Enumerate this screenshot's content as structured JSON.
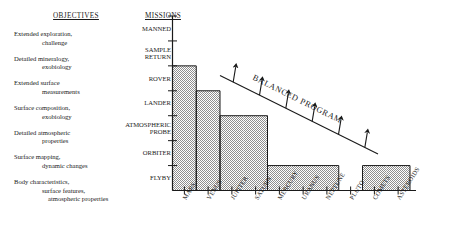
{
  "objectives": {
    "heading": "OBJECTIVES",
    "items": [
      [
        "Extended exploration,",
        "challenge"
      ],
      [
        "Detailed mineralogy,",
        "exobiology"
      ],
      [
        "Extended surface",
        "measurements"
      ],
      [
        "Surface composition,",
        "exobiology"
      ],
      [
        "Detailed atmospheric",
        "properties"
      ],
      [
        "Surface mapping,",
        "dynamic changes"
      ],
      [
        "Body characteristics,",
        "surface features,",
        "atmospheric properties"
      ]
    ]
  },
  "missions": {
    "heading": "MISSIONS",
    "levels": [
      {
        "label": "MANNED",
        "lines": [
          "MANNED"
        ]
      },
      {
        "label": "SAMPLE RETURN",
        "lines": [
          "SAMPLE",
          "RETURN"
        ]
      },
      {
        "label": "ROVER",
        "lines": [
          "ROVER"
        ]
      },
      {
        "label": "LANDER",
        "lines": [
          "LANDER"
        ]
      },
      {
        "label": "ATMOSPHERIC PROBE",
        "lines": [
          "ATMOSPHERIC",
          "PROBE"
        ]
      },
      {
        "label": "ORBITER",
        "lines": [
          "ORBITER"
        ]
      },
      {
        "label": "FLYBY",
        "lines": [
          "FLYBY"
        ]
      }
    ]
  },
  "annotation": {
    "balanced_program": "BALANCED PROGRAM",
    "arrow_count": 6
  },
  "chart_data": {
    "type": "bar",
    "title": "",
    "xlabel": "",
    "ylabel": "MISSIONS",
    "categories": [
      "MARS",
      "VENUS",
      "JUPITER",
      "SATURN",
      "MERCURY",
      "URANUS",
      "NEPTUNE",
      "PLUTO",
      "COMETS",
      "ASTEROIDS"
    ],
    "y_tick_labels": [
      "FLYBY",
      "ORBITER",
      "ATMOSPHERIC PROBE",
      "LANDER",
      "ROVER",
      "SAMPLE RETURN",
      "MANNED"
    ],
    "values": [
      5,
      4,
      3,
      3,
      1,
      1,
      1,
      0,
      1,
      1
    ],
    "value_labels": [
      "SAMPLE RETURN",
      "ROVER",
      "LANDER",
      "LANDER",
      "ORBITER",
      "ORBITER",
      "ORBITER",
      "(none)",
      "ORBITER",
      "ORBITER"
    ],
    "ylim": [
      0,
      7
    ],
    "grid": false,
    "legend": null,
    "fill": "#9b9b9b"
  },
  "colors": {
    "ink": "#1a1a1a",
    "bar_fill": "#9b9b9b",
    "paper": "#ffffff"
  }
}
